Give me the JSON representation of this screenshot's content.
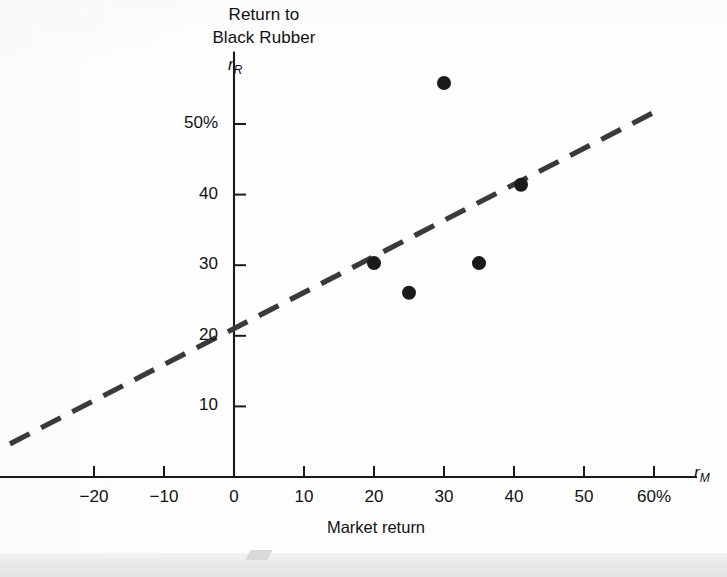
{
  "figure": {
    "title_line1": "Return to",
    "title_line2": "Black Rubber",
    "y_axis_symbol_base": "r",
    "y_axis_symbol_sub": "R",
    "x_axis_symbol_base": "r",
    "x_axis_symbol_sub": "M",
    "x_axis_caption": "Market return",
    "ink_color": "#1a1a1a",
    "line_color": "#3a3a3a",
    "background_color": "#fefefe"
  },
  "chart_data": {
    "type": "scatter",
    "title": "Return to Black Rubber",
    "xlabel": "Market return",
    "ylabel": "Return to Black Rubber",
    "x_axis_symbol": "rM",
    "y_axis_symbol": "rR",
    "xlim": [
      -33,
      63
    ],
    "ylim": [
      -3,
      60
    ],
    "grid": false,
    "legend": null,
    "xticks": [
      -20,
      -10,
      0,
      10,
      20,
      30,
      40,
      50,
      60
    ],
    "xtick_labels": [
      "−20",
      "−10",
      "0",
      "10",
      "20",
      "30",
      "40",
      "50",
      "60%"
    ],
    "yticks": [
      10,
      20,
      30,
      40,
      50
    ],
    "ytick_labels": [
      "10",
      "20",
      "30",
      "40",
      "50%"
    ],
    "points": [
      {
        "x": 20,
        "y": 30.3
      },
      {
        "x": 25,
        "y": 26.1
      },
      {
        "x": 30,
        "y": 55.8
      },
      {
        "x": 35,
        "y": 30.3
      },
      {
        "x": 41,
        "y": 41.4
      }
    ],
    "fit_line": {
      "style": "dashed",
      "intercept": 19.8,
      "slope": 0.47,
      "x_start": -32.0,
      "x_end": 59.7,
      "y_start": 4.7,
      "y_end": 51.5
    }
  }
}
